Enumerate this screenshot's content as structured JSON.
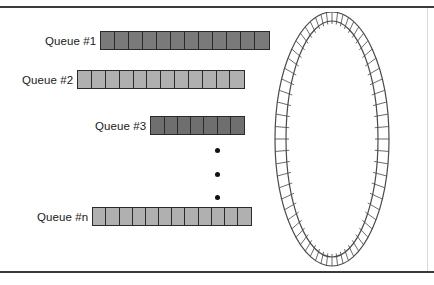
{
  "figure": {
    "background_color": "#ffffff",
    "frame": {
      "top_rule_color": "#3a3a3a",
      "bottom_rule_color": "#3a3a3a",
      "right_edge_color": "#d8d8d8"
    }
  },
  "queues": [
    {
      "label": "Queue #1",
      "cells": 12,
      "fill_color": "#7a7a7a",
      "border_color": "#2b2b2b",
      "left": 105,
      "top": 31,
      "width": 170,
      "label_left": 45
    },
    {
      "label": "Queue #2",
      "cells": 12,
      "fill_color": "#b0b0b0",
      "border_color": "#2b2b2b",
      "left": 82,
      "top": 70,
      "width": 168,
      "label_left": 22
    },
    {
      "label": "Queue #3",
      "cells": 7,
      "fill_color": "#6f6f6f",
      "border_color": "#2b2b2b",
      "left": 155,
      "top": 116,
      "width": 95,
      "label_left": 95
    },
    {
      "label": "Queue #n",
      "cells": 12,
      "fill_color": "#b0b0b0",
      "border_color": "#2b2b2b",
      "left": 97,
      "top": 207,
      "width": 160,
      "label_left": 37
    }
  ],
  "ellipsis": {
    "name": "vertical-ellipsis",
    "dot_count": 3,
    "dot_color": "#111111",
    "left": 215,
    "top": 148,
    "height": 52
  },
  "ring": {
    "name": "ring-network",
    "description": "Hatched ring / token-ring loop",
    "stroke_color": "#4a4a4a",
    "fill_color": "#ffffff",
    "hatch_color": "#5a5a5a",
    "segment_count": 64,
    "center_x": 60,
    "center_y": 127,
    "outer_rx": 57,
    "outer_ry": 127,
    "inner_rx": 46,
    "inner_ry": 118
  }
}
